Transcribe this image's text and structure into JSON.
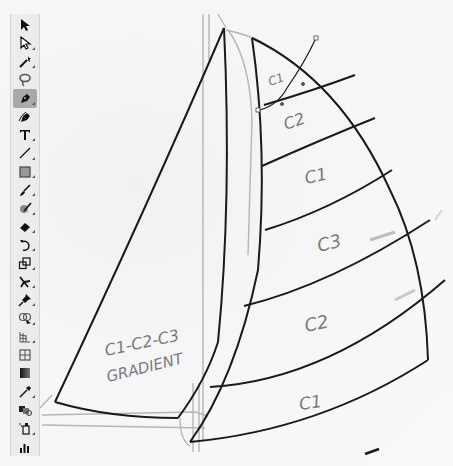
{
  "toolbar": {
    "tools": [
      {
        "name": "selection-tool",
        "icon": "black-arrow-icon",
        "active": false
      },
      {
        "name": "direct-selection-tool",
        "icon": "white-arrow-icon",
        "active": false
      },
      {
        "name": "magic-wand-tool",
        "icon": "magic-wand-icon",
        "active": false
      },
      {
        "name": "lasso-tool",
        "icon": "lasso-icon",
        "active": false
      },
      {
        "name": "pen-tool",
        "icon": "pen-icon",
        "active": true
      },
      {
        "name": "curvature-tool",
        "icon": "curvature-pen-icon",
        "active": false
      },
      {
        "name": "type-tool",
        "icon": "type-icon",
        "active": false
      },
      {
        "name": "line-segment-tool",
        "icon": "line-icon",
        "active": false
      },
      {
        "name": "rectangle-tool",
        "icon": "rectangle-icon",
        "active": false
      },
      {
        "name": "paintbrush-tool",
        "icon": "brush-icon",
        "active": false
      },
      {
        "name": "shaper-tool",
        "icon": "shaper-icon",
        "active": false
      },
      {
        "name": "eraser-tool",
        "icon": "eraser-icon",
        "active": false
      },
      {
        "name": "rotate-tool",
        "icon": "rotate-icon",
        "active": false
      },
      {
        "name": "scale-tool",
        "icon": "scale-icon",
        "active": false
      },
      {
        "name": "puppet-warp-tool",
        "icon": "puppet-warp-icon",
        "active": false
      },
      {
        "name": "pin-tool",
        "icon": "pin-icon",
        "active": false
      },
      {
        "name": "shape-builder-tool",
        "icon": "shape-builder-icon",
        "active": false
      },
      {
        "name": "perspective-grid-tool",
        "icon": "perspective-grid-icon",
        "active": false
      },
      {
        "name": "mesh-tool",
        "icon": "mesh-icon",
        "active": false
      },
      {
        "name": "gradient-tool",
        "icon": "gradient-icon",
        "active": false
      },
      {
        "name": "eyedropper-tool",
        "icon": "eyedropper-icon",
        "active": false
      },
      {
        "name": "blend-tool",
        "icon": "blend-icon",
        "active": false
      },
      {
        "name": "symbol-sprayer-tool",
        "icon": "symbol-sprayer-icon",
        "active": false
      },
      {
        "name": "column-graph-tool",
        "icon": "column-graph-icon",
        "active": false
      }
    ]
  },
  "canvas": {
    "sketch_labels": {
      "main_top": "C1",
      "main_2": "C2",
      "main_3": "C1",
      "main_4": "C3",
      "main_5": "C2",
      "main_6": "C1",
      "jib_line1": "C1-C2-C3",
      "jib_line2": "GRADIENT"
    },
    "colors": {
      "ink": "#1a1a1a",
      "pencil": "#8a8a8a",
      "paper": "#f6f6f6",
      "toolbar_bg": "#ececec",
      "active_tool_bg": "#a9a9a9"
    }
  }
}
